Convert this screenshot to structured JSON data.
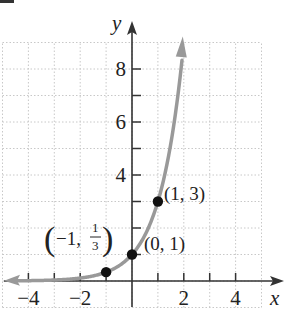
{
  "chart_data": {
    "type": "line",
    "title": "",
    "function": "y = 3^x",
    "xlabel": "x",
    "ylabel": "y",
    "xlim": [
      -5,
      5
    ],
    "ylim": [
      -1,
      9
    ],
    "grid": true,
    "x_tick_labels": [
      "−4",
      "−2",
      "2",
      "4"
    ],
    "x_tick_values": [
      -4,
      -2,
      2,
      4
    ],
    "x_minor_ticks": [
      -4,
      -3,
      -2,
      -1,
      1,
      2,
      3,
      4
    ],
    "y_tick_labels": [
      "2",
      "4",
      "6",
      "8"
    ],
    "y_tick_values": [
      2,
      4,
      6,
      8
    ],
    "y_visible_labels": [
      "4",
      "6",
      "8"
    ],
    "y_minor_ticks": [
      1,
      2,
      3,
      4,
      5,
      6,
      7,
      8
    ],
    "series": [
      {
        "name": "exponential curve",
        "color": "#999999",
        "x": [
          -5,
          -4,
          -3,
          -2,
          -1,
          -0.5,
          0,
          0.5,
          1,
          1.5,
          2
        ],
        "y": [
          0.0041,
          0.0123,
          0.037,
          0.111,
          0.333,
          0.577,
          1,
          1.732,
          3,
          5.196,
          9
        ]
      }
    ],
    "points": [
      {
        "x": -1,
        "y": 0.3333,
        "label_left": "−1,",
        "label_num": "1",
        "label_den": "3"
      },
      {
        "x": 0,
        "y": 1,
        "label": "(0, 1)"
      },
      {
        "x": 1,
        "y": 3,
        "label": "(1, 3)"
      }
    ],
    "colors": {
      "axis": "#333333",
      "curve": "#999999",
      "grid": "#c8c8c8",
      "point": "#111111"
    }
  }
}
